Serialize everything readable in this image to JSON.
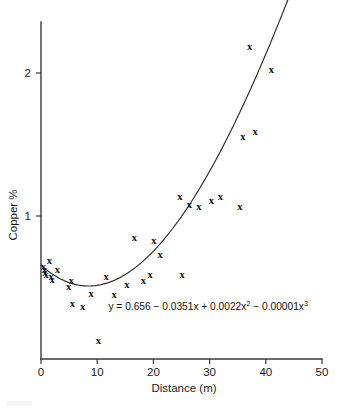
{
  "figure": {
    "background_color": "#ffffff",
    "marker_glyph": "x",
    "marker_color": "#111111",
    "curve_color": "#2b2b2b",
    "axis_color": "#3a3a3a"
  },
  "chart_data": {
    "type": "scatter",
    "title": "",
    "subtitle": "",
    "xlabel": "Distance (m)",
    "ylabel": "Copper %",
    "xlim": [
      0,
      50
    ],
    "ylim": [
      0,
      2.51
    ],
    "xticks": [
      0,
      10,
      20,
      30,
      40,
      50
    ],
    "xtick_labels": [
      "0",
      "10",
      "20",
      "30",
      "40",
      "50"
    ],
    "yticks": [
      1,
      2
    ],
    "ytick_labels": [
      "1",
      "2"
    ],
    "grid": false,
    "legend": null,
    "legend_position": "none",
    "annotations": [
      {
        "name": "regression-equation",
        "text": "y = 0.656 − 0.0351x + 0.0022x² − 0.00001x³",
        "text_parts": {
          "lead": "y = 0.656 − 0.0351x + 0.0022x",
          "sup1": "2",
          "mid": " − 0.00001x",
          "sup2": "3"
        },
        "x": 12.0,
        "y": 0.345
      }
    ],
    "series": [
      {
        "name": "Copper samples",
        "type": "scatter",
        "marker": "x",
        "points": [
          [
            0.4,
            0.64
          ],
          [
            0.6,
            0.62
          ],
          [
            0.7,
            0.6
          ],
          [
            0.9,
            0.58
          ],
          [
            1.5,
            0.68
          ],
          [
            1.8,
            0.57
          ],
          [
            2.0,
            0.55
          ],
          [
            2.9,
            0.62
          ],
          [
            4.9,
            0.5
          ],
          [
            5.4,
            0.54
          ],
          [
            5.6,
            0.38
          ],
          [
            7.4,
            0.36
          ],
          [
            8.9,
            0.45
          ],
          [
            10.2,
            0.12
          ],
          [
            11.6,
            0.57
          ],
          [
            13.0,
            0.44
          ],
          [
            15.3,
            0.51
          ],
          [
            16.6,
            0.84
          ],
          [
            18.2,
            0.54
          ],
          [
            19.4,
            0.58
          ],
          [
            20.1,
            0.82
          ],
          [
            21.2,
            0.72
          ],
          [
            24.7,
            1.13
          ],
          [
            25.1,
            0.58
          ],
          [
            26.4,
            1.07
          ],
          [
            28.1,
            1.06
          ],
          [
            30.3,
            1.1
          ],
          [
            31.9,
            1.13
          ],
          [
            35.4,
            1.06
          ],
          [
            35.9,
            1.55
          ],
          [
            37.1,
            2.18
          ],
          [
            38.1,
            1.58
          ],
          [
            41.0,
            2.02
          ]
        ]
      },
      {
        "name": "Cubic fit",
        "type": "line",
        "equation": "y = 0.656 - 0.0351x + 0.0022x^2 - 0.00001x^3",
        "coefficients": {
          "intercept": 0.656,
          "x": -0.0351,
          "x2": 0.0022,
          "x3": -1e-05
        },
        "x_range": [
          0.0,
          44.2
        ]
      }
    ]
  }
}
